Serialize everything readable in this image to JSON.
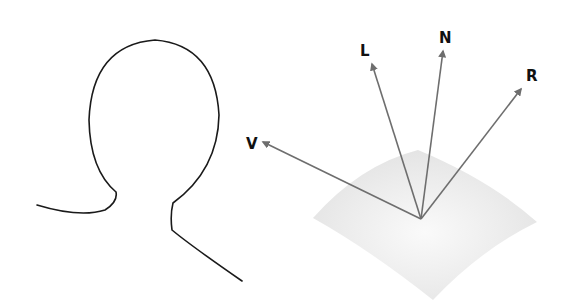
{
  "diagram": {
    "vectors": [
      {
        "id": "V",
        "label": "V",
        "meaning": "view vector"
      },
      {
        "id": "L",
        "label": "L",
        "meaning": "light vector"
      },
      {
        "id": "N",
        "label": "N",
        "meaning": "surface normal"
      },
      {
        "id": "R",
        "label": "R",
        "meaning": "reflection vector"
      }
    ],
    "colors": {
      "arrow": "#6e6e6e",
      "head_outline": "#1a1a1a",
      "surface": "#e6e6e6",
      "label": "#111111"
    }
  }
}
